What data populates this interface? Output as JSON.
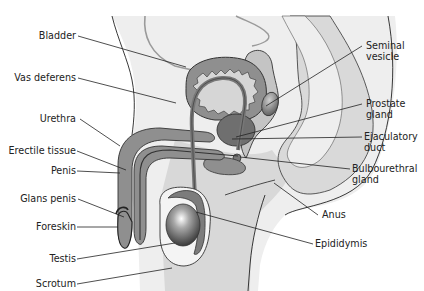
{
  "diagram": {
    "colors": {
      "body_fill": "#eeeeee",
      "tissue_fill": "#d3d3d3",
      "organ_fill": "#8f8f8f",
      "dark_fill": "#6f6f6f",
      "outline": "#333333",
      "leader": "#222222",
      "text": "#222222"
    },
    "labels_left": [
      {
        "id": "bladder",
        "text": "Bladder"
      },
      {
        "id": "vas-deferens",
        "text": "Vas deferens"
      },
      {
        "id": "urethra",
        "text": "Urethra"
      },
      {
        "id": "erectile-tissue",
        "text": "Erectile tissue"
      },
      {
        "id": "penis",
        "text": "Penis"
      },
      {
        "id": "glans-penis",
        "text": "Glans penis"
      },
      {
        "id": "foreskin",
        "text": "Foreskin"
      },
      {
        "id": "testis",
        "text": "Testis"
      },
      {
        "id": "scrotum",
        "text": "Scrotum"
      }
    ],
    "labels_right": [
      {
        "id": "seminal-vesicle",
        "line1": "Seminal",
        "line2": "vesicle"
      },
      {
        "id": "prostate-gland",
        "line1": "Prostate",
        "line2": "gland"
      },
      {
        "id": "ejaculatory-duct",
        "line1": "Ejaculatory",
        "line2": "duct"
      },
      {
        "id": "bulbourethral-gland",
        "line1": "Bulbourethral",
        "line2": "gland"
      },
      {
        "id": "anus",
        "line1": "Anus",
        "line2": ""
      },
      {
        "id": "epididymis",
        "line1": "Epididymis",
        "line2": ""
      }
    ]
  }
}
